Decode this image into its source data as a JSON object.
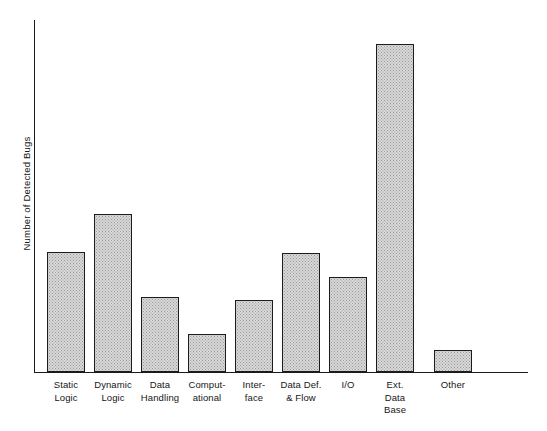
{
  "chart_data": {
    "type": "bar",
    "title": "",
    "xlabel": "",
    "ylabel": "Number of Detected Bugs",
    "categories": [
      "Static Logic",
      "Dynamic Logic",
      "Data Handling",
      "Computational",
      "Interface",
      "Data Def. & Flow",
      "I/O",
      "Ext. Data Base",
      "Other"
    ],
    "category_label_lines": [
      [
        "Static",
        "Logic"
      ],
      [
        "Dynamic",
        "Logic"
      ],
      [
        "Data",
        "Handling"
      ],
      [
        "Comput-",
        "ational"
      ],
      [
        "Inter-",
        "face"
      ],
      [
        "Data Def.",
        "& Flow"
      ],
      [
        "I/O"
      ],
      [
        "Ext.",
        "Data",
        "Base"
      ],
      [
        "Other"
      ]
    ],
    "values": [
      120,
      158,
      75,
      38,
      72,
      119,
      95,
      328,
      22
    ],
    "ylim": [
      0,
      353
    ],
    "grid": false,
    "legend": false,
    "axis_ticks_shown": false,
    "bar_fill_color": "#d8d8d8",
    "bar_edge_color": "#1c1c1c",
    "axis_color": "#1b1b1b",
    "background_color": "#ffffff"
  },
  "layout": {
    "plot_left": 34,
    "plot_top": 20,
    "plot_width": 494,
    "plot_height": 353,
    "bar_width": 38,
    "bar_left_offsets": [
      13,
      60,
      107,
      154,
      201,
      248,
      295,
      342,
      400
    ]
  }
}
